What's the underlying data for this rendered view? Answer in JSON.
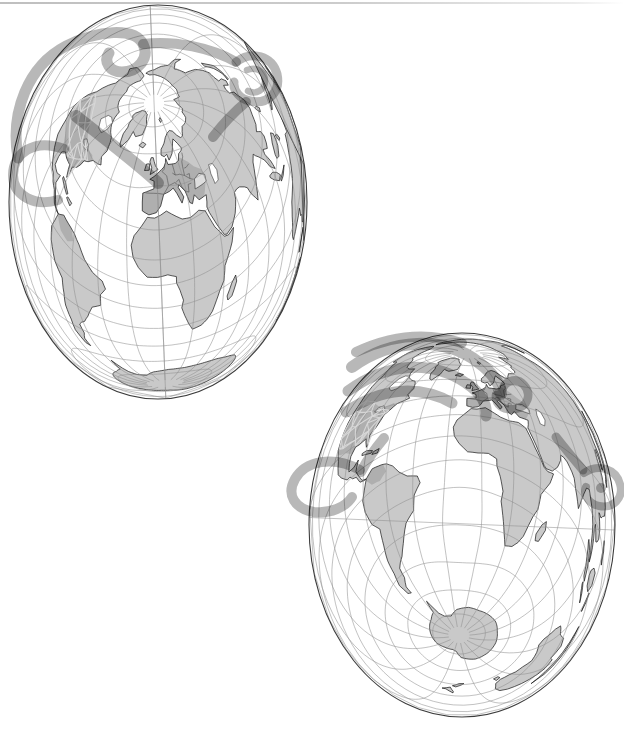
{
  "figure": {
    "type": "two-globe-map-figure",
    "background": "#ffffff",
    "top_rule_color": "#c6c6c6",
    "colors": {
      "land": "#c9c9c9",
      "coastline": "#161616",
      "graticule": "#8f8f8f",
      "globe_outline": "#3c3c3c",
      "ribbon": "#b3b3b3",
      "region_shade": "rgba(0,0,0,0.13)",
      "network_line": "#d8d8d8",
      "border_line": "#4a4a4a",
      "water": "#ffffff"
    },
    "projection": {
      "exponent": 0.8,
      "max_angle_deg": 171
    },
    "graticule": {
      "meridian_step_deg": 20,
      "parallel_step_deg": 15
    },
    "globes": [
      {
        "name": "upper-left-globe",
        "view": "north-atlantic-oblique",
        "cx": 158,
        "cy": 202,
        "rx": 149,
        "ry": 197,
        "center_lat": 40,
        "center_lon": 0,
        "rotation": -3
      },
      {
        "name": "lower-right-globe",
        "view": "south-atlantic-oblique",
        "cx": 462,
        "cy": 525,
        "rx": 153,
        "ry": 192,
        "center_lat": -30,
        "center_lon": -10,
        "rotation": 2
      }
    ],
    "features": {
      "highlighted_regions": [
        "europe-countries",
        "north-america-network",
        "south-america-network"
      ],
      "route_ribbons_per_globe": [
        7,
        9
      ],
      "ring_markers": [
        "caribbean-loop",
        "northeast-asia-loop",
        "black-sea-loop",
        "southeast-asia-loop"
      ]
    }
  }
}
